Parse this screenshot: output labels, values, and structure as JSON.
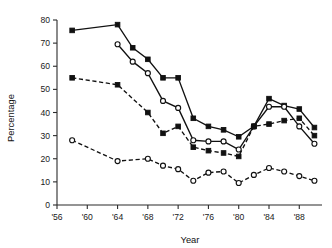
{
  "chart_data": {
    "type": "line",
    "title": "",
    "xlabel": "Year",
    "ylabel": "Percentage",
    "xlim": [
      1956,
      1991
    ],
    "ylim": [
      0,
      80
    ],
    "grid": false,
    "legend": "none",
    "x_tick_labels": [
      "'56",
      "'60",
      "'64",
      "'68",
      "'72",
      "'76",
      "'80",
      "'84",
      "'88"
    ],
    "x_tick_values": [
      1956,
      1960,
      1964,
      1968,
      1972,
      1976,
      1980,
      1984,
      1988
    ],
    "y_tick_labels": [
      "0",
      "10",
      "20",
      "30",
      "40",
      "50",
      "60",
      "70",
      "80"
    ],
    "y_tick_values": [
      0,
      10,
      20,
      30,
      40,
      50,
      60,
      70,
      80
    ],
    "x": [
      1958,
      1964,
      1966,
      1968,
      1970,
      1972,
      1974,
      1976,
      1978,
      1980,
      1982,
      1984,
      1986,
      1988,
      1990
    ],
    "series": [
      {
        "name": "series-1",
        "marker": "filled-square",
        "linestyle": "solid",
        "x": [
          1958,
          1964,
          1966,
          1968,
          1970,
          1972,
          1974,
          1976,
          1978,
          1980,
          1982,
          1984,
          1986,
          1988,
          1990
        ],
        "values": [
          75.5,
          78.0,
          68.0,
          63.0,
          55.0,
          55.0,
          37.5,
          34.0,
          32.5,
          29.5,
          34.0,
          46.0,
          43.0,
          41.5,
          33.5
        ]
      },
      {
        "name": "series-2",
        "marker": "open-circle",
        "linestyle": "solid",
        "x": [
          1964,
          1966,
          1968,
          1970,
          1972,
          1974,
          1976,
          1978,
          1980,
          1982,
          1984,
          1986,
          1988,
          1990
        ],
        "values": [
          69.5,
          62.0,
          57.0,
          45.0,
          42.0,
          28.0,
          27.5,
          27.5,
          24.0,
          34.0,
          42.5,
          42.5,
          34.0,
          26.5
        ]
      },
      {
        "name": "series-3",
        "marker": "filled-square",
        "linestyle": "dashed",
        "x": [
          1958,
          1964,
          1968,
          1970,
          1972,
          1974,
          1976,
          1978,
          1980,
          1982,
          1984,
          1986,
          1988,
          1990
        ],
        "values": [
          55.0,
          52.0,
          40.0,
          31.0,
          34.0,
          25.0,
          23.5,
          22.5,
          21.0,
          34.0,
          35.0,
          36.5,
          37.5,
          30.0
        ]
      },
      {
        "name": "series-4",
        "marker": "open-circle",
        "linestyle": "dashed",
        "x": [
          1958,
          1964,
          1968,
          1970,
          1972,
          1974,
          1976,
          1978,
          1980,
          1982,
          1984,
          1986,
          1988,
          1990
        ],
        "values": [
          28.0,
          19.0,
          20.0,
          17.0,
          15.5,
          10.5,
          14.0,
          14.5,
          9.5,
          13.0,
          16.0,
          14.5,
          12.5,
          10.5
        ]
      }
    ]
  }
}
